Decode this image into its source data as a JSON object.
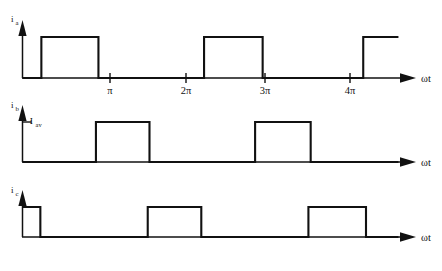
{
  "figure": {
    "background_color": "#ffffff",
    "line_color": "#111111",
    "width": 442,
    "height": 271
  },
  "axes": {
    "x_axis_label": "ωt",
    "tick_labels": [
      "π",
      "2π",
      "3π",
      "4π"
    ],
    "tick_values": [
      3.14159,
      6.28319,
      9.42478,
      12.56637
    ]
  },
  "plots": [
    {
      "id": "plot-ia",
      "y_axis_label_main": "i",
      "y_axis_label_sub": "a",
      "level_label_main": "",
      "level_label_sub": ""
    },
    {
      "id": "plot-ib",
      "y_axis_label_main": "i",
      "y_axis_label_sub": "b",
      "level_label_main": "I",
      "level_label_sub": "av"
    },
    {
      "id": "plot-ic",
      "y_axis_label_main": "i",
      "y_axis_label_sub": "c",
      "level_label_main": "",
      "level_label_sub": ""
    }
  ],
  "chart_data": {
    "type": "line",
    "xlabel": "ωt",
    "ylabel": "current",
    "xlim": [
      0,
      16.0
    ],
    "ylim": [
      0,
      1.35
    ],
    "grid": false,
    "legend": "none",
    "x_tick_values": [
      3.14159,
      6.28319,
      9.42478,
      12.56637
    ],
    "x_tick_labels": [
      "π",
      "2π",
      "3π",
      "4π"
    ],
    "annotations": [
      {
        "text": "I_av",
        "series": "i_b",
        "y_value": 1.0,
        "description": "average current level marker on i_b ordinate"
      }
    ],
    "series": [
      {
        "name": "i_a",
        "label_main": "i",
        "label_sub": "a",
        "low_value": 0,
        "high_value": 1,
        "transitions_wt": [
          0.75,
          3.02,
          7.22,
          9.55,
          13.55
        ],
        "segments": [
          {
            "from_wt": 0.0,
            "to_wt": 0.75,
            "value": 0
          },
          {
            "from_wt": 0.75,
            "to_wt": 3.02,
            "value": 1
          },
          {
            "from_wt": 3.02,
            "to_wt": 7.22,
            "value": 0
          },
          {
            "from_wt": 7.22,
            "to_wt": 9.55,
            "value": 1
          },
          {
            "from_wt": 9.55,
            "to_wt": 13.55,
            "value": 0
          },
          {
            "from_wt": 13.55,
            "to_wt": 14.95,
            "value": 1
          }
        ]
      },
      {
        "name": "i_b",
        "label_main": "i",
        "label_sub": "b",
        "low_value": 0,
        "high_value": 1,
        "transitions_wt": [
          2.92,
          5.05,
          9.25,
          11.46
        ],
        "segments": [
          {
            "from_wt": 0.0,
            "to_wt": 2.92,
            "value": 0
          },
          {
            "from_wt": 2.92,
            "to_wt": 5.05,
            "value": 1
          },
          {
            "from_wt": 5.05,
            "to_wt": 9.25,
            "value": 0
          },
          {
            "from_wt": 9.25,
            "to_wt": 11.46,
            "value": 1
          },
          {
            "from_wt": 11.46,
            "to_wt": 14.95,
            "value": 0
          }
        ]
      },
      {
        "name": "i_c",
        "label_main": "i",
        "label_sub": "c",
        "low_value": 0,
        "high_value": 1,
        "transitions_wt": [
          0.71,
          4.98,
          7.11,
          11.37,
          13.66
        ],
        "segments": [
          {
            "from_wt": 0.0,
            "to_wt": 0.71,
            "value": 1
          },
          {
            "from_wt": 0.71,
            "to_wt": 4.98,
            "value": 0
          },
          {
            "from_wt": 4.98,
            "to_wt": 7.11,
            "value": 1
          },
          {
            "from_wt": 7.11,
            "to_wt": 11.37,
            "value": 0
          },
          {
            "from_wt": 11.37,
            "to_wt": 13.66,
            "value": 1
          },
          {
            "from_wt": 13.66,
            "to_wt": 14.95,
            "value": 0
          }
        ]
      }
    ]
  }
}
